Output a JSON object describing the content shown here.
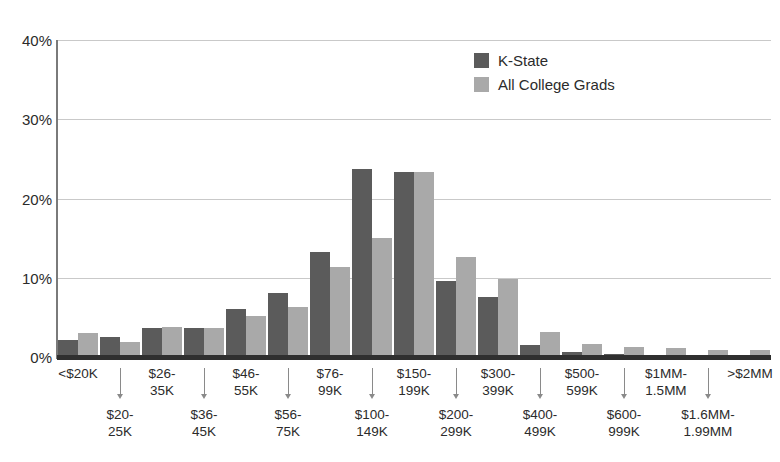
{
  "chart_data": {
    "type": "bar",
    "title": "",
    "xlabel": "",
    "ylabel": "",
    "ylim": [
      0,
      40
    ],
    "yticks": [
      "0%",
      "10%",
      "20%",
      "30%",
      "40%"
    ],
    "ytick_values": [
      0,
      10,
      20,
      30,
      40
    ],
    "grid": true,
    "legend_position": "top-right",
    "categories": [
      "<$20K",
      "$20-\n25K",
      "$26-\n35K",
      "$36-\n45K",
      "$46-\n55K",
      "$56-\n75K",
      "$76-\n99K",
      "$100-\n149K",
      "$150-\n199K",
      "$200-\n299K",
      "$300-\n399K",
      "$400-\n499K",
      "$500-\n599K",
      "$600-\n999K",
      "$1MM-\n1.5MM",
      "$1.6MM-\n1.99MM",
      ">$2MM"
    ],
    "series": [
      {
        "name": "K-State",
        "color": "#5b5b5b",
        "values": [
          2.2,
          2.5,
          3.7,
          3.7,
          6.0,
          8.1,
          13.3,
          23.7,
          23.3,
          9.6,
          7.6,
          1.5,
          0.6,
          0.4,
          0.3,
          0.2,
          0.2
        ]
      },
      {
        "name": "All College Grads",
        "color": "#a9a9a9",
        "values": [
          3.0,
          1.9,
          3.8,
          3.6,
          5.2,
          6.3,
          11.4,
          15.0,
          23.3,
          12.6,
          9.8,
          3.2,
          1.7,
          1.3,
          1.2,
          0.9,
          0.9
        ]
      }
    ]
  },
  "legend": {
    "items": [
      {
        "label": "K-State",
        "color": "#5b5b5b"
      },
      {
        "label": "All College Grads",
        "color": "#a9a9a9"
      }
    ]
  }
}
